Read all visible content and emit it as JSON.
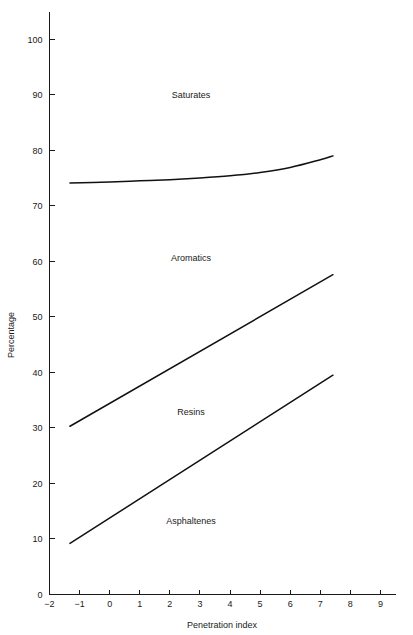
{
  "chart_data": {
    "type": "line",
    "title": "",
    "subtitle": "",
    "xlabel": "Penetration index",
    "ylabel": "Percentage",
    "xlim": [
      -2,
      9.5
    ],
    "ylim": [
      0,
      105
    ],
    "grid": false,
    "legend_position": "inline-region-labels",
    "xticks": [
      -2,
      -1,
      0,
      1,
      2,
      3,
      4,
      5,
      6,
      7,
      8,
      9
    ],
    "xtick_labels": [
      "−2",
      "−1",
      "0",
      "1",
      "2",
      "3",
      "4",
      "5",
      "6",
      "7",
      "8",
      "9"
    ],
    "yticks": [
      0,
      10,
      20,
      30,
      40,
      50,
      60,
      70,
      80,
      90,
      100
    ],
    "ytick_labels": [
      "0",
      "10",
      "20",
      "30",
      "40",
      "50",
      "60",
      "70",
      "80",
      "90",
      "100"
    ],
    "series": [
      {
        "name": "Saturates boundary",
        "x": [
          -1.32,
          0.0,
          1.0,
          2.0,
          3.0,
          4.0,
          5.0,
          6.0,
          7.0,
          7.42
        ],
        "values": [
          74.1,
          74.3,
          74.5,
          74.7,
          75.0,
          75.4,
          76.0,
          76.9,
          78.3,
          79.0
        ]
      },
      {
        "name": "Aromatics boundary",
        "x": [
          -1.32,
          7.42
        ],
        "values": [
          30.3,
          57.6
        ]
      },
      {
        "name": "Asphaltenes boundary",
        "x": [
          -1.32,
          7.42
        ],
        "values": [
          9.2,
          39.5
        ]
      }
    ],
    "region_labels": [
      {
        "text": "Saturates",
        "x": 2.7,
        "y": 89.5
      },
      {
        "text": "Aromatics",
        "x": 2.7,
        "y": 60.0
      },
      {
        "text": "Resins",
        "x": 2.7,
        "y": 32.3
      },
      {
        "text": "Asphaltenes",
        "x": 2.7,
        "y": 12.7
      }
    ],
    "colors": {
      "line": "#111111",
      "axis": "#1a1a1a",
      "text": "#1a1a1a",
      "background": "#ffffff"
    }
  }
}
